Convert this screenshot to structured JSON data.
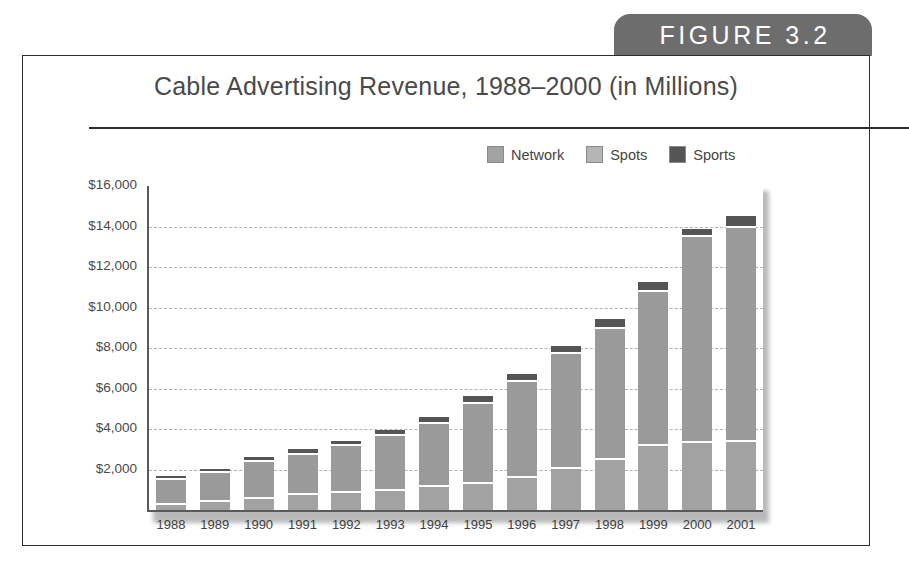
{
  "figure": {
    "tab_label": "FIGURE 3.2",
    "tab_color": "#6d6d6d",
    "border_color": "#2e2e2e"
  },
  "chart_data": {
    "type": "bar",
    "stacked": true,
    "title": "Cable Advertising Revenue, 1988–2000 (in Millions)",
    "xlabel": "",
    "ylabel": "",
    "ylim": [
      0,
      16000
    ],
    "ytick_labels": [
      "$16,000",
      "$14,000",
      "$12,000",
      "$10,000",
      "$8,000",
      "$6,000",
      "$4,000",
      "$2,000"
    ],
    "ytick_values": [
      16000,
      14000,
      12000,
      10000,
      8000,
      6000,
      4000,
      2000
    ],
    "grid": true,
    "legend_position": "top-right",
    "categories": [
      "1988",
      "1989",
      "1990",
      "1991",
      "1992",
      "1993",
      "1994",
      "1995",
      "1996",
      "1997",
      "1998",
      "1999",
      "2000",
      "2001"
    ],
    "series": [
      {
        "name": "Network",
        "color": "#a2a2a2",
        "values": [
          360,
          480,
          620,
          820,
          940,
          1050,
          1250,
          1400,
          1700,
          2100,
          2550,
          3250,
          3400,
          3450
        ]
      },
      {
        "name": "Spots",
        "color": "#9a9a9a",
        "values": [
          1200,
          1440,
          1860,
          2020,
          2300,
          2700,
          3100,
          3950,
          4700,
          5700,
          6500,
          7600,
          10200,
          10600
        ]
      },
      {
        "name": "Sports",
        "color": "#555555",
        "values": [
          100,
          120,
          150,
          160,
          180,
          200,
          250,
          300,
          300,
          300,
          400,
          400,
          300,
          450
        ]
      }
    ],
    "totals": [
      1660,
      2040,
      2630,
      3000,
      3420,
      3950,
      4600,
      5650,
      6700,
      8100,
      9450,
      11250,
      13900,
      14500
    ]
  },
  "legend": {
    "items": [
      {
        "label": "Network",
        "color": "#a2a2a2"
      },
      {
        "label": "Spots",
        "color": "#b5b5b5"
      },
      {
        "label": "Sports",
        "color": "#555555"
      }
    ]
  }
}
